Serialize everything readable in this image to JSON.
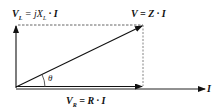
{
  "diagram": {
    "labels": {
      "vl": {
        "main": "V",
        "sub": "L",
        "rest": " = jX",
        "rest_sub": "L",
        "tail": " · I"
      },
      "v": {
        "text": "V = Z · I"
      },
      "vr": {
        "main": "V",
        "sub": "R",
        "tail": " = R · I"
      },
      "i": {
        "text": "I"
      },
      "theta": {
        "text": "θ"
      }
    },
    "colors": {
      "line": "#111111",
      "dashed": "#555555",
      "background": "#ffffff"
    },
    "geometry": {
      "origin": [
        16,
        87
      ],
      "vl_tip": [
        16,
        25
      ],
      "v_tip": [
        143,
        25
      ],
      "vr_tip": [
        143,
        87
      ],
      "i_tip": [
        206,
        88
      ]
    }
  }
}
